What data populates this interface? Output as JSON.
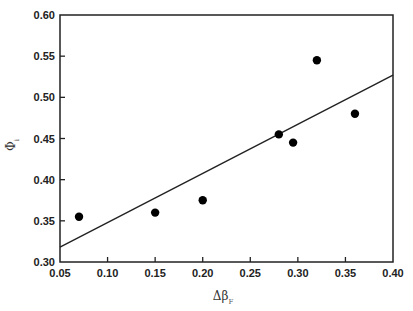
{
  "chart_data": {
    "type": "scatter",
    "title": "",
    "xlabel": "Δβ",
    "xlabel_subscript": "F",
    "ylabel": "Φ",
    "ylabel_subscript": "i",
    "xlim": [
      0.05,
      0.4
    ],
    "ylim": [
      0.3,
      0.6
    ],
    "xticks": [
      "0.05",
      "0.10",
      "0.15",
      "0.20",
      "0.25",
      "0.30",
      "0.35",
      "0.40"
    ],
    "yticks": [
      "0.30",
      "0.35",
      "0.40",
      "0.45",
      "0.50",
      "0.55",
      "0.60"
    ],
    "grid": false,
    "legend": null,
    "series": [
      {
        "name": "data",
        "marker": "filled-circle",
        "color": "#000000",
        "points": [
          {
            "x": 0.07,
            "y": 0.355
          },
          {
            "x": 0.15,
            "y": 0.36
          },
          {
            "x": 0.2,
            "y": 0.375
          },
          {
            "x": 0.28,
            "y": 0.455
          },
          {
            "x": 0.295,
            "y": 0.445
          },
          {
            "x": 0.32,
            "y": 0.545
          },
          {
            "x": 0.36,
            "y": 0.48
          }
        ]
      },
      {
        "name": "linear fit",
        "type": "line",
        "color": "#222222",
        "points": [
          {
            "x": 0.05,
            "y": 0.318
          },
          {
            "x": 0.4,
            "y": 0.527
          }
        ]
      }
    ]
  }
}
